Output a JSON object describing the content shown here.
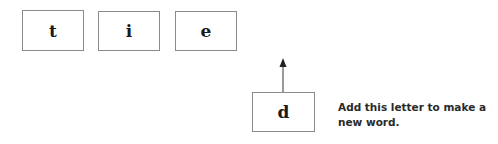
{
  "word_tiles": [
    {
      "letter": "t"
    },
    {
      "letter": "i"
    },
    {
      "letter": "e"
    }
  ],
  "added_tile": {
    "letter": "d"
  },
  "arrow": {
    "direction": "up"
  },
  "caption": {
    "text": "Add this letter to make a new word."
  }
}
